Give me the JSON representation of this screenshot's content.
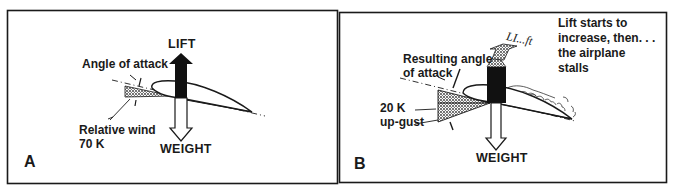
{
  "figure": {
    "panels": [
      {
        "id": "A",
        "panel_label": "A",
        "lift_label": "LIFT",
        "weight_label": "WEIGHT",
        "angle_label": "Angle of attack",
        "wind_label_line1": "Relative wind",
        "wind_label_line2": "70 K"
      },
      {
        "id": "B",
        "panel_label": "B",
        "lift_label": "LI...ft",
        "weight_label": "WEIGHT",
        "angle_label_line1": "Resulting angle",
        "angle_label_line2": "of attack",
        "gust_label_line1": "20 K",
        "gust_label_line2": "up-gust",
        "caption_line1": "Lift starts to",
        "caption_line2": "increase, then. . .",
        "caption_line3": "the airplane",
        "caption_line4": "stalls"
      }
    ],
    "colors": {
      "ink": "#1a1a1a",
      "background": "#ffffff",
      "stipple": "#6b6b6b"
    }
  }
}
